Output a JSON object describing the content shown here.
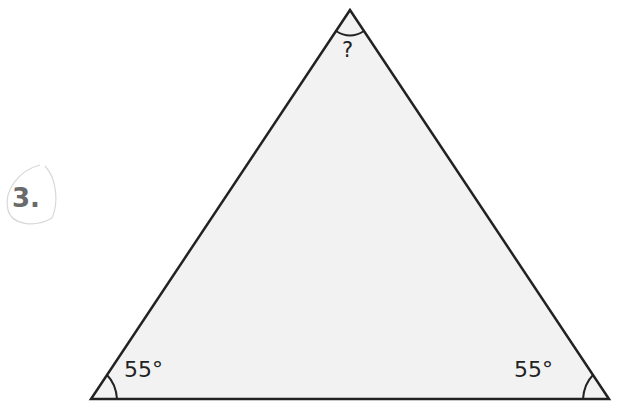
{
  "problem": {
    "number": "3."
  },
  "triangle": {
    "fill_color": "#f2f2f2",
    "stroke_color": "#222222",
    "vertices": {
      "top": [
        350,
        10
      ],
      "bottom_left": [
        91,
        399
      ],
      "bottom_right": [
        609,
        399
      ]
    },
    "angles": {
      "top": "?",
      "bottom_left": "55°",
      "bottom_right": "55°"
    }
  }
}
